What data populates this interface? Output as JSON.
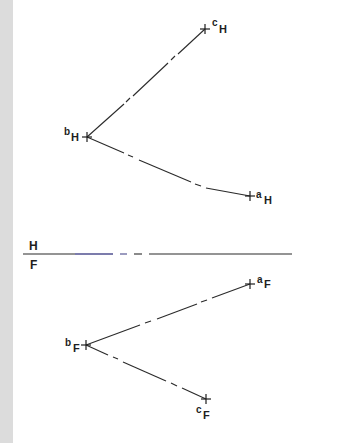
{
  "figure": {
    "type": "descriptive-geometry orthographic projection",
    "background_color": "#ffffff",
    "band_color": "#dcdcdc",
    "line_color": "#2a2a2a"
  },
  "fold_line": {
    "upper_label": "H",
    "lower_label": "F",
    "y": 254,
    "x_start": 23,
    "x_end": 292
  },
  "horizontal_view": {
    "points": [
      {
        "name": "a",
        "subscript": "H",
        "x": 250,
        "y": 196
      },
      {
        "name": "b",
        "subscript": "H",
        "x": 87,
        "y": 137
      },
      {
        "name": "c",
        "subscript": "H",
        "x": 205,
        "y": 29
      }
    ],
    "lines": [
      {
        "from": "b",
        "to": "c",
        "style": "dash-dot"
      },
      {
        "from": "b",
        "to": "a",
        "style": "dash-dot"
      }
    ]
  },
  "frontal_view": {
    "points": [
      {
        "name": "a",
        "subscript": "F",
        "x": 250,
        "y": 284
      },
      {
        "name": "b",
        "subscript": "F",
        "x": 86,
        "y": 345
      },
      {
        "name": "c",
        "subscript": "F",
        "x": 206,
        "y": 399
      }
    ],
    "lines": [
      {
        "from": "b",
        "to": "a",
        "style": "dash-dot"
      },
      {
        "from": "b",
        "to": "c",
        "style": "dash-dot"
      }
    ]
  }
}
